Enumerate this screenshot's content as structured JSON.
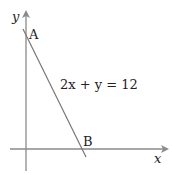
{
  "diagram": {
    "axes": {
      "x_label": "x",
      "y_label": "y",
      "color": "#8a8a8a"
    },
    "line": {
      "equation": "2x + y = 12",
      "color": "#777777"
    },
    "points": [
      {
        "label": "A",
        "description": "y-intercept"
      },
      {
        "label": "B",
        "description": "x-intercept"
      }
    ]
  }
}
